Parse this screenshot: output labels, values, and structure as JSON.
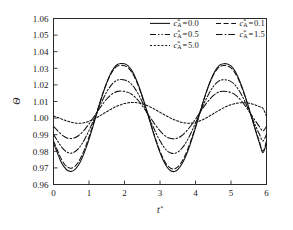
{
  "chart_data": {
    "type": "line",
    "title": "",
    "xlabel": "t*",
    "ylabel": "Θ",
    "xlim": [
      0,
      6
    ],
    "ylim": [
      0.96,
      1.06
    ],
    "xticks": [
      0,
      1,
      2,
      3,
      4,
      5,
      6
    ],
    "xtick_labels": [
      "0",
      "1",
      "2",
      "3",
      "4",
      "5",
      "6"
    ],
    "yticks": [
      0.96,
      0.97,
      0.98,
      0.99,
      1.0,
      1.01,
      1.02,
      1.03,
      1.04,
      1.05,
      1.06
    ],
    "ytick_labels": [
      "0.96",
      "0.97",
      "0.98",
      "0.99",
      "1.00",
      "1.01",
      "1.02",
      "1.03",
      "1.04",
      "1.05",
      "1.06"
    ],
    "grid": false,
    "legend_position": "upper-center",
    "legend_title": "",
    "x": [
      0,
      0.1,
      0.2,
      0.3,
      0.4,
      0.5,
      0.6,
      0.7,
      0.8,
      0.9,
      1.0,
      1.1,
      1.2,
      1.3,
      1.4,
      1.5,
      1.6,
      1.7,
      1.8,
      1.9,
      2.0,
      2.1,
      2.2,
      2.3,
      2.4,
      2.5,
      2.6,
      2.7,
      2.8,
      2.9,
      3.0,
      3.1,
      3.2,
      3.3,
      3.4,
      3.5,
      3.6,
      3.7,
      3.8,
      3.9,
      4.0,
      4.1,
      4.2,
      4.3,
      4.4,
      4.5,
      4.6,
      4.7,
      4.8,
      4.9,
      5.0,
      5.1,
      5.2,
      5.3,
      5.4,
      5.5,
      5.6,
      5.7,
      5.8,
      5.9,
      6.0
    ],
    "series": [
      {
        "name": "c*_A = 0.0",
        "label_prefix": "c",
        "label_sub": "A",
        "label_sup": "*",
        "label_value": "0.0",
        "dash": "none",
        "dasharray": "",
        "color": "#111111",
        "values": [
          0.985,
          0.9795,
          0.9742,
          0.9706,
          0.9684,
          0.9679,
          0.969,
          0.9716,
          0.9757,
          0.981,
          0.9872,
          0.9941,
          1.0013,
          1.0085,
          1.0153,
          1.0213,
          1.0264,
          1.0301,
          1.0323,
          1.0329,
          1.0327,
          1.0315,
          1.0289,
          1.0248,
          1.0195,
          1.0133,
          1.0064,
          0.9992,
          0.992,
          0.9852,
          0.9792,
          0.9741,
          0.9704,
          0.9683,
          0.9678,
          0.969,
          0.9717,
          0.9758,
          0.9811,
          0.9873,
          0.9941,
          1.0013,
          1.0086,
          1.0153,
          1.0213,
          1.0263,
          1.03,
          1.0322,
          1.0328,
          1.0326,
          1.0314,
          1.0288,
          1.0247,
          1.0194,
          1.0131,
          1.0063,
          0.9991,
          0.9919,
          0.9851,
          0.9791,
          0.985
        ]
      },
      {
        "name": "c*_A = 0.1",
        "label_prefix": "c",
        "label_sub": "A",
        "label_sup": "*",
        "label_value": "0.1",
        "dash": "dashed",
        "dasharray": "5,2.6",
        "color": "#111111",
        "values": [
          0.9862,
          0.9812,
          0.9762,
          0.9725,
          0.9704,
          0.9698,
          0.9709,
          0.9735,
          0.9775,
          0.9826,
          0.9886,
          0.9952,
          1.0021,
          1.009,
          1.0155,
          1.0212,
          1.0259,
          1.0293,
          1.0313,
          1.0318,
          1.0315,
          1.0303,
          1.0278,
          1.0239,
          1.0188,
          1.0128,
          1.0062,
          0.9993,
          0.9924,
          0.9859,
          0.9801,
          0.9752,
          0.9717,
          0.9698,
          0.9694,
          0.9706,
          0.9733,
          0.9772,
          0.9823,
          0.9883,
          0.9949,
          1.0019,
          1.0088,
          1.0153,
          1.0211,
          1.0258,
          1.0292,
          1.0312,
          1.0317,
          1.0314,
          1.0302,
          1.0277,
          1.0238,
          1.0187,
          1.0127,
          1.0061,
          0.9992,
          0.9923,
          0.9858,
          0.98,
          0.9862
        ]
      },
      {
        "name": "c*_A = 0.5",
        "label_prefix": "c",
        "label_sub": "A",
        "label_sup": "*",
        "label_value": "0.5",
        "dash": "dash-dot-dot",
        "dasharray": "6,2,1.4,2,1.4,2",
        "color": "#111111",
        "values": [
          0.9902,
          0.9868,
          0.9834,
          0.9808,
          0.9793,
          0.9789,
          0.9797,
          0.9816,
          0.9845,
          0.9882,
          0.9925,
          0.9973,
          1.0022,
          1.0071,
          1.0117,
          1.0158,
          1.0191,
          1.0215,
          1.0229,
          1.0232,
          1.023,
          1.0221,
          1.0204,
          1.0176,
          1.014,
          1.0097,
          1.0049,
          1.0,
          0.9951,
          0.9904,
          0.9863,
          0.9828,
          0.9803,
          0.979,
          0.9787,
          0.9795,
          0.9814,
          0.9842,
          0.9879,
          0.9922,
          0.997,
          1.0019,
          1.0068,
          1.0115,
          1.0156,
          1.019,
          1.0214,
          1.0228,
          1.0231,
          1.0229,
          1.022,
          1.0203,
          1.0175,
          1.0139,
          1.0096,
          1.0048,
          0.9999,
          0.995,
          0.9903,
          0.9862,
          0.9902
        ]
      },
      {
        "name": "c*_A = 1.5",
        "label_prefix": "c",
        "label_sub": "A",
        "label_sup": "*",
        "label_value": "1.5",
        "dash": "dash-dot",
        "dasharray": "6.5,2.2,1.5,2.2",
        "color": "#111111",
        "values": [
          0.995,
          0.9928,
          0.9906,
          0.9889,
          0.9879,
          0.9877,
          0.9882,
          0.9894,
          0.9913,
          0.9937,
          0.9965,
          0.9996,
          1.0028,
          1.0059,
          1.0089,
          1.0115,
          1.0137,
          1.0152,
          1.0161,
          1.0163,
          1.0161,
          1.0155,
          1.0144,
          1.0126,
          1.0103,
          1.0075,
          1.0044,
          1.0012,
          0.998,
          0.995,
          0.9924,
          0.9901,
          0.9885,
          0.9877,
          0.9875,
          0.988,
          0.9892,
          0.9911,
          0.9935,
          0.9963,
          0.9994,
          1.0026,
          1.0057,
          1.0087,
          1.0113,
          1.0135,
          1.0151,
          1.016,
          1.0162,
          1.016,
          1.0154,
          1.0143,
          1.0125,
          1.0102,
          1.0074,
          1.0043,
          1.0011,
          0.9979,
          0.9949,
          0.9923,
          0.995
        ]
      },
      {
        "name": "c*_A = 5.0",
        "label_prefix": "c",
        "label_sub": "A",
        "label_sup": "*",
        "label_value": "5.0",
        "dash": "dotted",
        "dasharray": "2,1.8",
        "color": "#111111",
        "values": [
          1.0012,
          1.0005,
          0.9997,
          0.9988,
          0.9981,
          0.9975,
          0.9971,
          0.9969,
          0.997,
          0.9974,
          0.9981,
          0.999,
          1.0001,
          1.0013,
          1.0026,
          1.0039,
          1.0051,
          1.0063,
          1.0073,
          1.0081,
          1.0088,
          1.0092,
          1.0094,
          1.0094,
          1.0091,
          1.0086,
          1.0079,
          1.007,
          1.0059,
          1.0047,
          1.0035,
          1.0023,
          1.0011,
          1.0,
          0.999,
          0.9982,
          0.9975,
          0.9971,
          0.9969,
          0.997,
          0.9974,
          0.9981,
          0.999,
          1.0001,
          1.0013,
          1.0026,
          1.0039,
          1.0051,
          1.0063,
          1.0073,
          1.0081,
          1.0087,
          1.0091,
          1.0093,
          1.0093,
          1.009,
          1.0085,
          1.0078,
          1.0069,
          1.0058,
          1.0012
        ]
      }
    ]
  },
  "axes": {
    "y_label": "Θ",
    "x_label": "t",
    "x_label_sup": "*"
  },
  "legend": {
    "rows": [
      [
        "c*_A = 0.0",
        "c*_A = 0.1"
      ],
      [
        "c*_A = 0.5",
        "c*_A = 1.5"
      ],
      [
        "c*_A = 5.0"
      ]
    ],
    "entries": [
      {
        "prefix": "c",
        "sub": "A",
        "sup": "*",
        "eq": "=",
        "value": "0.0"
      },
      {
        "prefix": "c",
        "sub": "A",
        "sup": "*",
        "eq": "=",
        "value": "0.1"
      },
      {
        "prefix": "c",
        "sub": "A",
        "sup": "*",
        "eq": "=",
        "value": "0.5"
      },
      {
        "prefix": "c",
        "sub": "A",
        "sup": "*",
        "eq": "=",
        "value": "1.5"
      },
      {
        "prefix": "c",
        "sub": "A",
        "sup": "*",
        "eq": "=",
        "value": "5.0"
      }
    ]
  }
}
